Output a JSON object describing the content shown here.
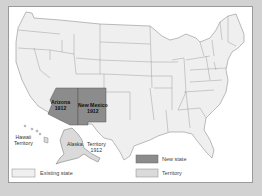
{
  "map": {
    "labels": {
      "arizona": {
        "name": "Arizona",
        "year": "1912"
      },
      "new_mexico": {
        "name": "New Mexico",
        "year": "1912"
      },
      "hawaii": {
        "line1": "Hawaii",
        "line2": "Territory"
      },
      "alaska": {
        "name": "Alaska",
        "line1": "Territory",
        "year": "1912"
      }
    },
    "legend": [
      {
        "label": "New state",
        "color": "#8c8c8c"
      },
      {
        "label": "Territory",
        "color": "#dadada"
      },
      {
        "label": "Existing state",
        "color": "#efefef"
      }
    ],
    "colors": {
      "background": "#d2d2d2",
      "panel": "#ffffff",
      "existing_state": "#efefef",
      "new_state": "#8c8c8c",
      "territory": "#dadada",
      "border": "#777777"
    }
  }
}
